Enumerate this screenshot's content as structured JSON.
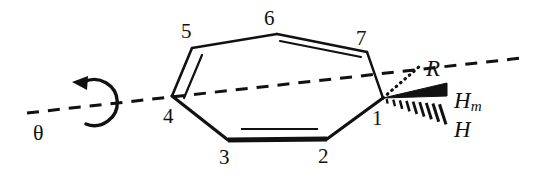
{
  "figure": {
    "kind": "chemical-structure-diagram",
    "background_color": "#ffffff",
    "stroke_color": "#111111",
    "width": 552,
    "height": 173
  },
  "ring": {
    "name": "cycloheptatriene-ring",
    "vertices": [
      {
        "id": "C1",
        "label": "1",
        "x": 383,
        "y": 98,
        "label_x": 372,
        "label_y": 108
      },
      {
        "id": "C2",
        "label": "2",
        "x": 327,
        "y": 139,
        "label_x": 318,
        "label_y": 146
      },
      {
        "id": "C3",
        "label": "3",
        "x": 228,
        "y": 140,
        "label_x": 219,
        "label_y": 147
      },
      {
        "id": "C4",
        "label": "4",
        "x": 172,
        "y": 96,
        "label_x": 163,
        "label_y": 106
      },
      {
        "id": "C5",
        "label": "5",
        "x": 192,
        "y": 48,
        "label_x": 181,
        "label_y": 21
      },
      {
        "id": "C6",
        "label": "6",
        "x": 277,
        "y": 34,
        "label_x": 264,
        "label_y": 8
      },
      {
        "id": "C7",
        "label": "7",
        "x": 367,
        "y": 52,
        "label_x": 356,
        "label_y": 28
      }
    ],
    "bonds": [
      {
        "from": "C1",
        "to": "C2",
        "order": 1,
        "style": "plain"
      },
      {
        "from": "C2",
        "to": "C3",
        "order": 2,
        "style": "bold-front"
      },
      {
        "from": "C3",
        "to": "C4",
        "order": 1,
        "style": "plain"
      },
      {
        "from": "C4",
        "to": "C5",
        "order": 2,
        "style": "plain"
      },
      {
        "from": "C5",
        "to": "C6",
        "order": 1,
        "style": "plain"
      },
      {
        "from": "C6",
        "to": "C7",
        "order": 2,
        "style": "plain"
      },
      {
        "from": "C7",
        "to": "C1",
        "order": 1,
        "style": "plain"
      }
    ]
  },
  "substituents": [
    {
      "id": "R",
      "label": "R",
      "bond_style": "dotted-back",
      "label_x": 426,
      "label_y": 57,
      "tip_x": 418,
      "tip_y": 68
    },
    {
      "id": "Hm",
      "label": "H",
      "sub": "m",
      "bond_style": "bold-wedge-front",
      "label_x": 454,
      "label_y": 89,
      "tip_x": 446,
      "tip_y": 93
    },
    {
      "id": "H",
      "label": "H",
      "bond_style": "hashed-back",
      "label_x": 454,
      "label_y": 118,
      "tip_x": 443,
      "tip_y": 123
    }
  ],
  "axis": {
    "name": "rotation-axis",
    "style": "dashed",
    "x1": 27,
    "y1": 113,
    "x2": 522,
    "y2": 58
  },
  "rotation": {
    "name": "rotation-arrow",
    "direction": "counterclockwise",
    "center_x": 102,
    "center_y": 103,
    "radius": 23,
    "angle_label": "θ",
    "label_x": 33,
    "label_y": 122
  }
}
